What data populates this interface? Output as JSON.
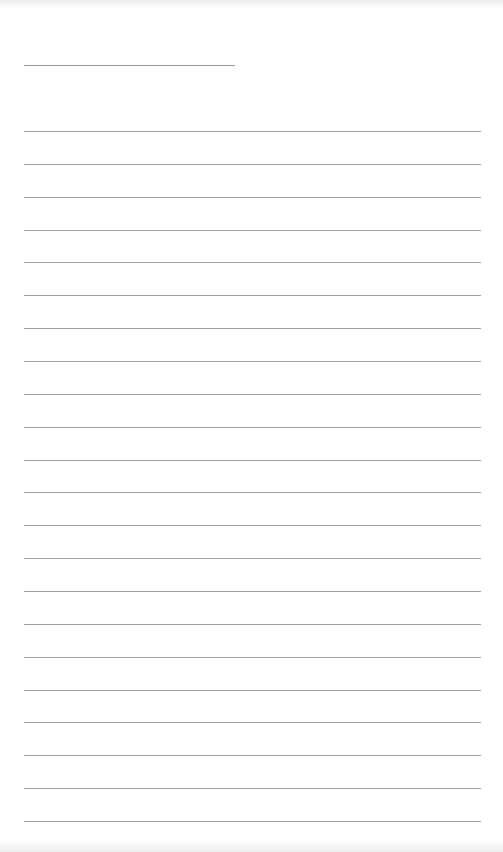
{
  "page": {
    "type": "lined-paper",
    "title_line": {
      "x": 24,
      "y": 65,
      "width": 211
    },
    "ruled_lines": {
      "count": 22,
      "first_y": 131,
      "spacing": 32.86,
      "x": 24,
      "width": 457
    },
    "line_color": "#9e9e9e",
    "background": "#ffffff"
  }
}
